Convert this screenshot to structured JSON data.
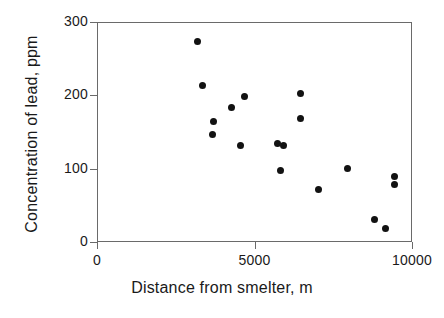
{
  "chart_data": {
    "type": "scatter",
    "title": "",
    "xlabel": "Distance from smelter, m",
    "ylabel": "Concentration of lead, ppm",
    "xlim": [
      0,
      10000
    ],
    "ylim": [
      0,
      300
    ],
    "xticks": [
      0,
      5000,
      10000
    ],
    "xtick_labels": [
      "0",
      "5000",
      "10000"
    ],
    "yticks": [
      0,
      100,
      200,
      300
    ],
    "ytick_labels": [
      "0",
      "100",
      "200",
      "300"
    ],
    "grid": false,
    "legend": null,
    "marker": "filled-circle",
    "marker_color": "#121212",
    "frame_color": "#6a6a6a",
    "points": [
      {
        "x": 3175,
        "y": 273
      },
      {
        "x": 3365,
        "y": 214
      },
      {
        "x": 3651,
        "y": 147
      },
      {
        "x": 3714,
        "y": 164
      },
      {
        "x": 4254,
        "y": 184
      },
      {
        "x": 4571,
        "y": 132
      },
      {
        "x": 4667,
        "y": 198
      },
      {
        "x": 5746,
        "y": 135
      },
      {
        "x": 5905,
        "y": 132
      },
      {
        "x": 5841,
        "y": 98
      },
      {
        "x": 6476,
        "y": 202
      },
      {
        "x": 6476,
        "y": 169
      },
      {
        "x": 7016,
        "y": 71
      },
      {
        "x": 7968,
        "y": 100
      },
      {
        "x": 9429,
        "y": 89
      },
      {
        "x": 9429,
        "y": 79
      },
      {
        "x": 8794,
        "y": 31
      },
      {
        "x": 9143,
        "y": 19
      }
    ]
  }
}
